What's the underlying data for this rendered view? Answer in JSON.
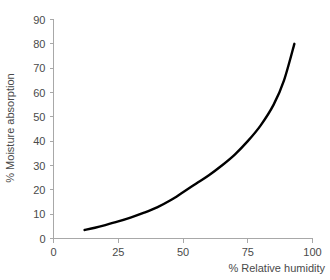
{
  "chart_data": {
    "type": "line",
    "title": "",
    "xlabel": "% Relative humidity",
    "ylabel": "% Moisture absorption",
    "xlim": [
      0,
      100
    ],
    "ylim": [
      0,
      90
    ],
    "xticks": [
      0,
      25,
      50,
      75,
      100
    ],
    "yticks": [
      0,
      10,
      20,
      30,
      40,
      50,
      60,
      70,
      80,
      90
    ],
    "xtick_labels": [
      "0",
      "25",
      "50",
      "75",
      "100"
    ],
    "ytick_labels": [
      "0",
      "10",
      "20",
      "30",
      "40",
      "50",
      "60",
      "70",
      "80",
      "90"
    ],
    "grid": false,
    "legend": null,
    "series": [
      {
        "name": "Moisture absorption vs relative humidity",
        "color": "#000000",
        "line_width": 2.4,
        "x": [
          12,
          16,
          20,
          25,
          30,
          35,
          40,
          45,
          50,
          55,
          60,
          65,
          70,
          75,
          80,
          85,
          89,
          93
        ],
        "y": [
          3.5,
          4.4,
          5.5,
          7.0,
          8.7,
          10.6,
          12.8,
          15.6,
          19.0,
          22.5,
          26.0,
          30.0,
          34.5,
          40.0,
          46.5,
          55.0,
          65.0,
          80.0
        ]
      }
    ]
  },
  "axes": {
    "y_axis_title": "% Moisture absorption",
    "x_axis_title": "% Relative humidity",
    "axis_color": "#a8a8a8",
    "label_color": "#4a4a4a"
  }
}
